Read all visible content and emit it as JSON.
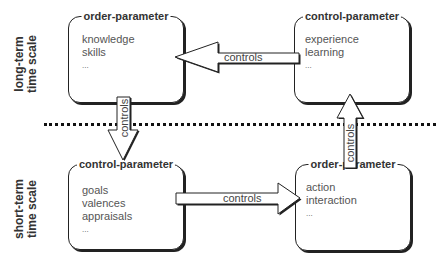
{
  "side_labels": {
    "top": [
      "long-term",
      "time scale"
    ],
    "bottom": [
      "short-term",
      "time scale"
    ]
  },
  "boxes": {
    "top_left": {
      "title": "order-parameter",
      "items": [
        "knowledge",
        "skills",
        "..."
      ]
    },
    "top_right": {
      "title": "control-parameter",
      "items": [
        "experience",
        "learning",
        "..."
      ]
    },
    "bottom_left": {
      "title": "control-parameter",
      "items": [
        "goals",
        "valences",
        "appraisals",
        "..."
      ]
    },
    "bottom_right": {
      "title": "order-parameter",
      "items": [
        "action",
        "interaction",
        "..."
      ]
    }
  },
  "arrows": {
    "top_horizontal": {
      "label": "controls",
      "direction": "left"
    },
    "bottom_horizontal": {
      "label": "controls",
      "direction": "right"
    },
    "left_vertical": {
      "label": "controls",
      "direction": "down"
    },
    "right_vertical": {
      "label": "controls",
      "direction": "up"
    }
  },
  "colors": {
    "stroke": "#222222",
    "text": "#444444",
    "background": "#ffffff"
  }
}
